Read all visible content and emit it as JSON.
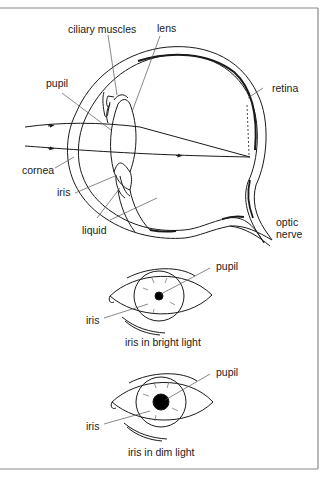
{
  "diagram": {
    "frame_color": "#8a8a8a",
    "line_color": "#1a1a1a",
    "leader_color": "#555555",
    "main_eye": {
      "labels": {
        "ciliary_muscles": "ciliary muscles",
        "lens": "lens",
        "pupil": "pupil",
        "retina": "retina",
        "cornea": "cornea",
        "iris": "iris",
        "liquid": "liquid",
        "optic_line1": "optic",
        "optic_line2": "nerve"
      }
    },
    "bright_eye": {
      "labels": {
        "pupil": "pupil",
        "iris": "iris"
      },
      "caption": "iris in bright light"
    },
    "dim_eye": {
      "labels": {
        "pupil": "pupil",
        "iris": "iris"
      },
      "caption": "iris in dim light"
    }
  }
}
